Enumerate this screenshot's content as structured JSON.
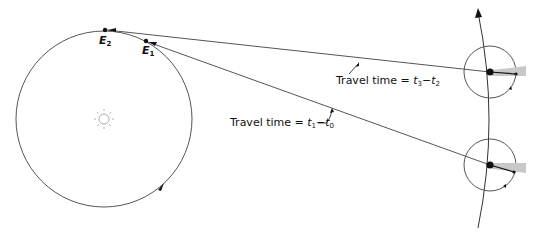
{
  "diagram": {
    "title": "",
    "colors": {
      "line": "#555555",
      "dot": "#111111",
      "shadow": "#c8c8c8",
      "sun": "#999999"
    },
    "earth_positions": [
      {
        "id": "E2",
        "label": "E",
        "sub": "2"
      },
      {
        "id": "E1",
        "label": "E",
        "sub": "1"
      }
    ],
    "labels": {
      "upper": {
        "prefix": "Travel time = ",
        "t_a": "t",
        "sub_a": "3",
        "minus": "−",
        "t_b": "t",
        "sub_b": "2"
      },
      "lower": {
        "prefix": "Travel time = ",
        "t_a": "t",
        "sub_a": "1",
        "minus": "−",
        "t_b": "t",
        "sub_b": "0"
      }
    },
    "icons": {
      "sun": "sun-icon",
      "planet_upper": "planet-icon",
      "planet_lower": "planet-icon"
    }
  }
}
